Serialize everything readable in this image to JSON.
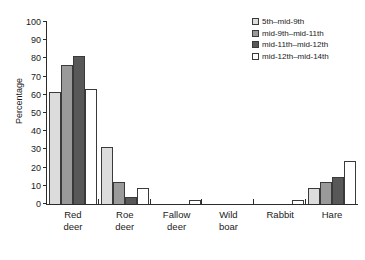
{
  "chart_data": {
    "type": "bar",
    "title": "",
    "xlabel": "",
    "ylabel": "Percentage",
    "ylim": [
      0,
      100
    ],
    "yticks": [
      0,
      10,
      20,
      30,
      40,
      50,
      60,
      70,
      80,
      90,
      100
    ],
    "grid": false,
    "legend_position": "top-right",
    "categories": [
      "Red deer",
      "Roe deer",
      "Fallow deer",
      "Wild boar",
      "Rabbit",
      "Hare"
    ],
    "category_lines": [
      [
        "Red",
        "deer"
      ],
      [
        "Roe",
        "deer"
      ],
      [
        "Fallow",
        "deer"
      ],
      [
        "Wild",
        "boar"
      ],
      [
        "Rabbit"
      ],
      [
        "Hare"
      ]
    ],
    "series": [
      {
        "name": "5th–mid-9th",
        "color": "#dcdcdc",
        "values": [
          61,
          31,
          0,
          0,
          0,
          8.5
        ]
      },
      {
        "name": "mid-9th–mid-11th",
        "color": "#9a9a9a",
        "values": [
          76,
          12,
          0,
          0,
          0,
          12
        ]
      },
      {
        "name": "mid-11th–mid-12th",
        "color": "#585858",
        "values": [
          81,
          4,
          0,
          0,
          0,
          15
        ]
      },
      {
        "name": "mid-12th–mid-14th",
        "color": "#ffffff",
        "values": [
          63,
          8.5,
          2,
          0,
          2,
          23.5
        ]
      }
    ]
  },
  "colors": {
    "axis": "#2b2b2b",
    "bar_outline": "#3a3a3a",
    "series_0": "#dcdcdc",
    "series_1": "#9a9a9a",
    "series_2": "#585858",
    "series_3": "#ffffff",
    "background": "#ffffff"
  }
}
